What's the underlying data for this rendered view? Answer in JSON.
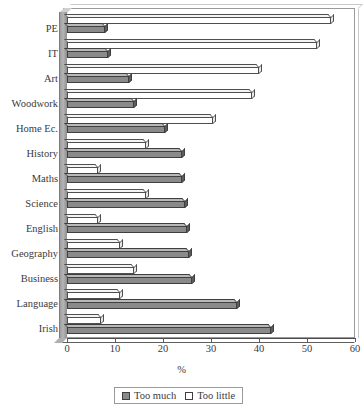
{
  "chart_data": {
    "type": "bar",
    "orientation": "horizontal",
    "title": "",
    "xlabel": "%",
    "ylabel": "",
    "xlim": [
      0,
      60
    ],
    "xticks": [
      0,
      10,
      20,
      30,
      40,
      50,
      60
    ],
    "xtick_labels": [
      "0",
      "10",
      "20",
      "30",
      "40",
      "50",
      "60"
    ],
    "grid": false,
    "legend_position": "bottom",
    "categories": [
      "PE",
      "IT",
      "Art",
      "Woodwork",
      "Home Ec.",
      "History",
      "Maths",
      "Science",
      "English",
      "Geography",
      "Business",
      "Language",
      "Irish"
    ],
    "series": [
      {
        "name": "Too much",
        "color": "#8a8a8a",
        "values": [
          8.0,
          8.5,
          13.0,
          14.0,
          20.5,
          24.0,
          24.0,
          24.5,
          25.0,
          25.5,
          26.0,
          35.5,
          42.5
        ]
      },
      {
        "name": "Too little",
        "color": "#ffffff",
        "values": [
          55.0,
          52.0,
          40.0,
          38.5,
          30.5,
          16.5,
          6.5,
          16.5,
          6.5,
          11.0,
          14.0,
          11.0,
          7.0
        ]
      }
    ]
  },
  "legend": {
    "items": [
      {
        "label": "Too much",
        "swatch": "much-swatch-icon"
      },
      {
        "label": "Too little",
        "swatch": "little-swatch-icon"
      }
    ]
  },
  "axis": {
    "x_title": "%"
  }
}
